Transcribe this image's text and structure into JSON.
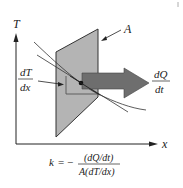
{
  "diagram": {
    "axes": {
      "y_label": "T",
      "x_label": "x"
    },
    "labels": {
      "area": "A",
      "gradient_num": "dT",
      "gradient_den": "dx",
      "flow_num": "dQ",
      "flow_den": "dt"
    },
    "formula": {
      "lhs": "k",
      "equals_minus": "= −",
      "numerator": "(dQ/dt)",
      "denominator": "A(dT/dx)"
    },
    "colors": {
      "plate_fill": "#b4b4b4",
      "plate_stroke": "#333333",
      "arrow_fill": "#6e6e6e",
      "axis": "#222222",
      "point": "#111111"
    }
  }
}
